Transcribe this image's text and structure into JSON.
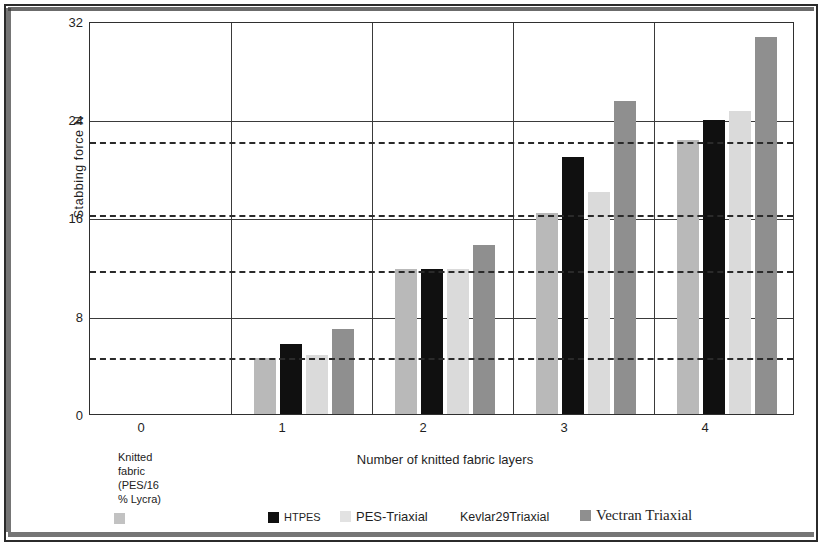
{
  "chart_data": {
    "type": "bar",
    "title": "",
    "xlabel": "Number of knitted fabric layers",
    "ylabel": "Stabbing  force  N",
    "categories": [
      "0",
      "1",
      "2",
      "3",
      "4"
    ],
    "xtick_labels": [
      "0",
      "1",
      "2",
      "3",
      "4"
    ],
    "ytick_labels": [
      "32",
      "24",
      "16",
      "8",
      "0"
    ],
    "ylim": [
      0,
      32
    ],
    "ytick_values": [
      0,
      8,
      16,
      24,
      32
    ],
    "grid": "horizontal and vertical",
    "legend_position": "bottom",
    "series": [
      {
        "name": "Knitted fabric (PES/16 % Lycra)",
        "color": "#b9b9b9",
        "values": [
          null,
          4.6,
          11.8,
          16.4,
          22.3
        ]
      },
      {
        "name": "HTPES",
        "color": "#101010",
        "values": [
          null,
          5.7,
          11.8,
          20.9,
          23.9
        ]
      },
      {
        "name": "PES-Triaxial",
        "color": "#dadada",
        "values": [
          null,
          4.8,
          11.8,
          18.1,
          24.7
        ]
      },
      {
        "name": "Kevlar29Triaxial",
        "color": "#ffffff",
        "values": [
          null,
          null,
          null,
          null,
          null
        ]
      },
      {
        "name": "Vectran Triaxial",
        "color": "#8f8f8f",
        "values": [
          null,
          6.9,
          13.8,
          25.5,
          30.7
        ]
      }
    ],
    "reference_lines": [
      4.7,
      11.8,
      16.4,
      22.3
    ],
    "annotations": {
      "zero_tick_note": "Knitted fabric (PES/16 % Lycra)"
    }
  },
  "legend": {
    "items": [
      {
        "label": "Knitted fabric (PES/16 % Lycra)",
        "swatch": "s0"
      },
      {
        "label": "HTPES",
        "swatch": "s1"
      },
      {
        "label": "PES-Triaxial",
        "swatch": "s2"
      },
      {
        "label": "Kevlar29Triaxial",
        "swatch": "none"
      },
      {
        "label": "Vectran Triaxial",
        "swatch": "s3"
      }
    ],
    "label_0": "Knitted",
    "label_0b": "fabric",
    "label_0c": "(PES/16",
    "label_0d": "% Lycra)",
    "label_1": "HTPES",
    "label_2": "PES-Triaxial",
    "label_3": "Kevlar29Triaxial",
    "label_4": "Vectran Triaxial"
  },
  "axes": {
    "y_label": "Stabbing  force  N",
    "x_label": "Number of knitted fabric layers",
    "y_0": "0",
    "y_8": "8",
    "y_16": "16",
    "y_24": "24",
    "y_32": "32",
    "x_0": "0",
    "x_1": "1",
    "x_2": "2",
    "x_3": "3",
    "x_4": "4"
  },
  "zero_note": {
    "line1": "Knitted",
    "line2": "fabric",
    "line3": "(PES/16",
    "line4": "% Lycra)"
  }
}
